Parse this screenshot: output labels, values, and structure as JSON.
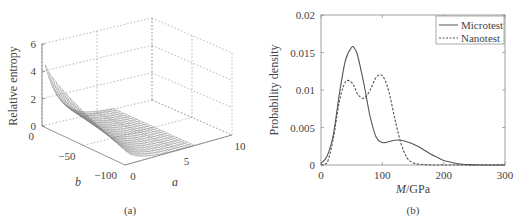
{
  "chart_data": [
    {
      "type": "surface",
      "panel_label": "(a)",
      "title": "",
      "xlabel": "a",
      "ylabel": "b",
      "zlabel": "Relative entropy",
      "x_ticks": [
        "0",
        "5",
        "10"
      ],
      "y_ticks": [
        "0",
        "-50",
        "-100"
      ],
      "z_ticks": [
        "0",
        "2",
        "4",
        "6"
      ],
      "xlim": [
        0,
        10
      ],
      "ylim": [
        -100,
        0
      ],
      "zlim": [
        0,
        6
      ],
      "grid": true,
      "description": "Mesh surface of relative entropy over (a, b); near zero for most of the domain, rising sharply to about 5.5 at small a and b near 0.",
      "surface_peak": {
        "a": 0,
        "b": 0,
        "z": 5.5
      },
      "edge_profile_b0": {
        "a": [
          0,
          1,
          2,
          3,
          4,
          5
        ],
        "z": [
          5.5,
          3.0,
          1.2,
          0.5,
          0.2,
          0.05
        ]
      },
      "edge_profile_a0": {
        "b": [
          0,
          -25,
          -50,
          -75,
          -100
        ],
        "z": [
          5.5,
          3.5,
          2.2,
          1.4,
          1.0
        ]
      }
    },
    {
      "type": "line",
      "panel_label": "(b)",
      "title": "",
      "xlabel": "M/GPa",
      "ylabel": "Probability density",
      "xlim": [
        0,
        300
      ],
      "ylim": [
        0,
        0.02
      ],
      "x_ticks": [
        "0",
        "100",
        "200",
        "300"
      ],
      "y_ticks": [
        "0",
        "0.005",
        "0.01",
        "0.015",
        "0.02"
      ],
      "grid": false,
      "legend_position": "upper right",
      "x": [
        0,
        10,
        20,
        30,
        40,
        50,
        55,
        60,
        70,
        80,
        90,
        100,
        110,
        120,
        130,
        140,
        150,
        160,
        170,
        180,
        190,
        200,
        210,
        220,
        230,
        240,
        250,
        260,
        280,
        300
      ],
      "series": [
        {
          "name": "Microtest",
          "style": "solid",
          "values": [
            0.0002,
            0.0012,
            0.004,
            0.0095,
            0.014,
            0.0157,
            0.0155,
            0.0145,
            0.0108,
            0.0065,
            0.0037,
            0.003,
            0.0031,
            0.0033,
            0.0033,
            0.0031,
            0.0028,
            0.0024,
            0.0019,
            0.0014,
            0.001,
            0.0006,
            0.0004,
            0.0002,
            0.0001,
            5e-05,
            2e-05,
            0.0,
            0.0,
            0.0
          ]
        },
        {
          "name": "Nanotest",
          "style": "dashed",
          "values": [
            0.0,
            0.0003,
            0.0035,
            0.0085,
            0.0111,
            0.011,
            0.0103,
            0.0094,
            0.0089,
            0.01,
            0.0117,
            0.0119,
            0.01,
            0.0063,
            0.003,
            0.001,
            0.0003,
            0.0001,
            5e-05,
            0.0,
            0.0,
            0.0,
            0.0,
            0.0,
            0.0,
            0.0,
            0.0,
            0.0,
            0.0,
            0.0
          ]
        }
      ]
    }
  ],
  "figure": {
    "panel_a_label": "(a)",
    "panel_b_label": "(b)"
  }
}
